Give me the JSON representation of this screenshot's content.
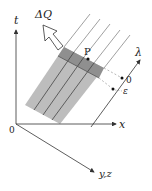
{
  "diagram": {
    "axes": {
      "t_label": "t",
      "x_label": "x",
      "yz_label": "y,z",
      "origin_label": "0"
    },
    "flux_label": "ΔQ",
    "point_label": "P",
    "lambda_axis": {
      "label": "λ",
      "zero_label": "0",
      "epsilon_label": "ε"
    },
    "colors": {
      "strip_fill": "#b8b8b8",
      "band_fill": "#8e8e8e",
      "line": "#333333",
      "guide_line": "#999999"
    }
  }
}
